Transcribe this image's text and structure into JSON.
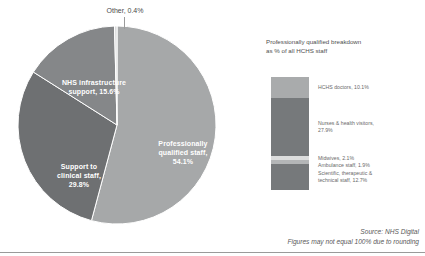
{
  "chart_data": {
    "type": "pie",
    "title": "",
    "categories": [
      "Professionally qualified staff",
      "Support to clinical staff",
      "NHS infrastructure support",
      "Other"
    ],
    "values": [
      54.1,
      29.8,
      15.6,
      0.4
    ],
    "unit": "%",
    "labels": [
      "Professionally\nqualified staff,\n54.1%",
      "Support to\nclinical staff,\n29.8%",
      "NHS infrastructure\nsupport, 15.6%",
      "Other, 0.4%"
    ],
    "colors": [
      "#a6a8a9",
      "#6e7072",
      "#858789",
      "#d8d9da"
    ],
    "legend": "none",
    "grid": false,
    "secondary_chart": {
      "type": "bar",
      "orientation": "vertical-stacked",
      "title": "Professionally qualified breakdown\nas % of all HCHS staff",
      "categories": [
        "HCHS doctors",
        "Nurses & health visitors",
        "Midwives",
        "Ambulance staff",
        "Scientific, therapeutic & technical staff"
      ],
      "values": [
        10.1,
        27.9,
        2.1,
        1.9,
        12.7
      ],
      "unit": "%",
      "colors": [
        "#a9abac",
        "#76797b",
        "#dcdddd",
        "#b4b6b7",
        "#76797b"
      ],
      "labels": [
        "HCHS doctors, 10.1%",
        "Nurses & health visitors,\n27.9%",
        "Midwives, 2.1%\nAmbulance staff, 1.9%",
        "Scientific, therapeutic &\ntechnical staff, 12.7%"
      ]
    }
  },
  "pie": {
    "slices": [
      {
        "name": "professionally-qualified",
        "label": "Professionally\nqualified staff,\n54.1%",
        "value": 54.1,
        "color": "#a6a8a9"
      },
      {
        "name": "support-clinical",
        "label": "Support to\nclinical staff,\n29.8%",
        "value": 29.8,
        "color": "#6e7072"
      },
      {
        "name": "infrastructure",
        "label": "NHS infrastructure\nsupport, 15.6%",
        "value": 15.6,
        "color": "#858789"
      },
      {
        "name": "other",
        "label": "Other, 0.4%",
        "value": 0.4,
        "color": "#d8d9da"
      }
    ]
  },
  "breakdown": {
    "title": "Professionally qualified breakdown\nas % of all HCHS staff",
    "segments": [
      {
        "name": "hchs-doctors",
        "label": "HCHS doctors, 10.1%",
        "value": 10.1,
        "color": "#a9abac"
      },
      {
        "name": "nurses-health-visitors",
        "label": "Nurses & health visitors,\n27.9%",
        "value": 27.9,
        "color": "#76797b"
      },
      {
        "name": "midwives",
        "label": "Midwives, 2.1%",
        "value": 2.1,
        "color": "#dcdddd"
      },
      {
        "name": "ambulance-staff",
        "label": "Ambulance staff, 1.9%",
        "value": 1.9,
        "color": "#b4b6b7"
      },
      {
        "name": "scientific-therapeutic-technical",
        "label": "Scientific, therapeutic &\ntechnical staff, 12.7%",
        "value": 12.7,
        "color": "#76797b"
      }
    ],
    "label_midwives_ambulance": "Midwives, 2.1%\nAmbulance staff, 1.9%"
  },
  "footer": {
    "source": "Source: NHS Digital",
    "note": "Figures may not equal 100% due to rounding"
  }
}
